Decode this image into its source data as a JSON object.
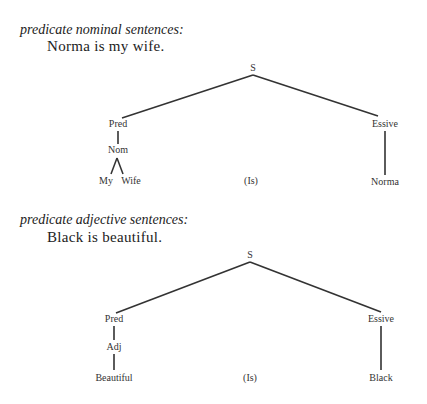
{
  "sections": [
    {
      "heading": "predicate nominal sentences:",
      "example": "Norma is my wife.",
      "tree": {
        "root": "S",
        "left": "Pred",
        "left_child": "Nom",
        "left_leaves": [
          "My",
          "Wife"
        ],
        "middle_leaf": "(Is)",
        "right": "Essive",
        "right_leaf": "Norma"
      }
    },
    {
      "heading": "predicate adjective sentences:",
      "example": "Black is beautiful.",
      "tree": {
        "root": "S",
        "left": "Pred",
        "left_child": "Adj",
        "left_leaf": "Beautiful",
        "middle_leaf": "(Is)",
        "right": "Essive",
        "right_leaf": "Black"
      }
    }
  ]
}
